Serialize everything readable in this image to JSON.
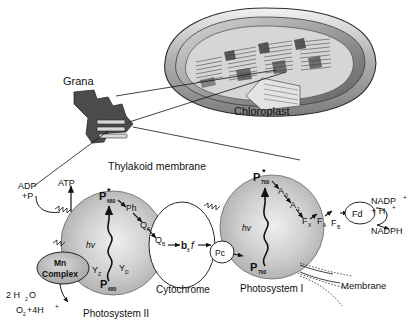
{
  "figure": {
    "title_top": "Chloroplast",
    "grana_label": "Grana",
    "subtitle": "Thylakoid membrane"
  },
  "upper": {
    "chloroplast_label": "Chloroplast",
    "grana_label": "Grana"
  },
  "photosystem2": {
    "name": "Photosystem II",
    "reaction_center_excited": "P",
    "reaction_center_excited_sub": "680",
    "reaction_center_excited_star": "*",
    "reaction_center_ground": "P",
    "reaction_center_ground_sub": "680",
    "photon": "hv",
    "pheophytin": "Ph",
    "qa": "Q",
    "qa_sub": "A",
    "qb": "Q",
    "qb_sub": "B",
    "yz": "Y",
    "yz_sub": "Z",
    "yd": "Y",
    "yd_sub": "D",
    "mn_complex_line1": "Mn",
    "mn_complex_line2": "Complex",
    "water": "2 H",
    "water_sub": "2",
    "water_tail": "O",
    "oxygen": "O",
    "oxygen_sub": "2",
    "oxygen_tail": "+4H",
    "oxygen_sup": "+"
  },
  "atp": {
    "adp": "ADP",
    "phosphate": "+P",
    "atp": "ATP"
  },
  "cytochrome": {
    "name": "Cytochrome",
    "complex": "b",
    "complex_sub": "6",
    "complex_tail": "f",
    "plastocyanin": "Pc"
  },
  "photosystem1": {
    "name": "Photosystem I",
    "reaction_center_excited": "P",
    "reaction_center_excited_sub": "700",
    "reaction_center_excited_star": "*",
    "reaction_center_ground": "P",
    "reaction_center_ground_sub": "700",
    "photon": "hv",
    "a0": "A",
    "a0_sub": "0",
    "a1": "A",
    "a1_sub": "1",
    "fx": "F",
    "fx_sub": "X",
    "fa": "F",
    "fa_sub": "A",
    "fb": "F",
    "fb_sub": "B",
    "ferredoxin": "Fd"
  },
  "nadp": {
    "oxidized": "NADP",
    "oxidized_sup": "+",
    "proton": "+ H",
    "proton_sup": "+",
    "reduced": "NADPH"
  },
  "membrane": {
    "label": "Membrane"
  },
  "colors": {
    "background": "#ffffff",
    "ink": "#111111",
    "photosystem_fill": "#b9b9b9",
    "photosystem_highlight": "#e8e8e8",
    "mn_fill": "#b0b0b0",
    "white_fill": "#ffffff",
    "grana_dark": "#4a4a4a",
    "chloroplast_gray": "#9a9a9a"
  }
}
